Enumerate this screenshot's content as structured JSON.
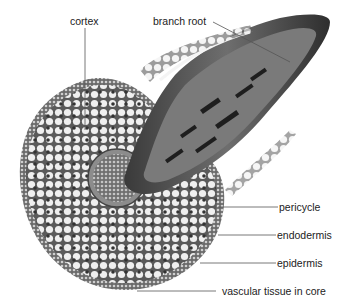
{
  "diagram": {
    "labels": {
      "cortex": "cortex",
      "branch_root": "branch root",
      "pericycle": "pericycle",
      "endodermis": "endodermis",
      "epidermis": "epidermis",
      "vascular_tissue": "vascular tissue in core"
    },
    "colors": {
      "leader_line": "#555555",
      "label_text": "#222222",
      "tissue_light": "#e6e6e6",
      "tissue_dark": "#2a2a2a"
    }
  }
}
